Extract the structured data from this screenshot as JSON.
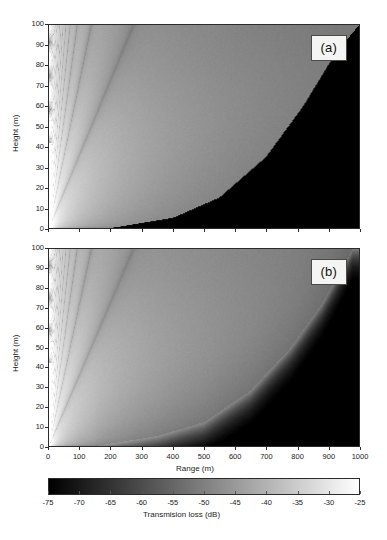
{
  "figure": {
    "background": "#ffffff",
    "width": 387,
    "height": 540
  },
  "panels": [
    {
      "tag": "(a)",
      "name": "panel-a",
      "xlabel": "",
      "ylabel": "Height (m)",
      "xlim": [
        0,
        1000
      ],
      "ylim": [
        0,
        100
      ],
      "show_xticklabels": false,
      "shadow_boundary": "sharp",
      "description": "Transmission loss field with sharp shadow-zone boundary"
    },
    {
      "tag": "(b)",
      "name": "panel-b",
      "xlabel": "Range (m)",
      "ylabel": "Height (m)",
      "xlim": [
        0,
        1000
      ],
      "ylim": [
        0,
        100
      ],
      "show_xticklabels": true,
      "shadow_boundary": "diffuse",
      "description": "Transmission loss field with diffuse shadow-zone boundary"
    }
  ],
  "axes": {
    "xticks": [
      0,
      100,
      200,
      300,
      400,
      500,
      600,
      700,
      800,
      900,
      1000
    ],
    "yticks": [
      0,
      10,
      20,
      30,
      40,
      50,
      60,
      70,
      80,
      90,
      100
    ],
    "xlabel": "Range (m)",
    "ylabel": "Height (m)"
  },
  "colorbar": {
    "label": "Transmision loss (dB)",
    "ticks": [
      -75,
      -70,
      -65,
      -60,
      -55,
      -50,
      -45,
      -40,
      -35,
      -30,
      -25
    ],
    "vmin": -75,
    "vmax": -25,
    "cmap": "gray",
    "low_color": "#000000",
    "high_color": "#ffffff",
    "orientation": "horizontal"
  },
  "chart_data": {
    "type": "heatmap",
    "title": "",
    "xlabel": "Range (m)",
    "ylabel": "Height (m)",
    "xlim": [
      0,
      1000
    ],
    "ylim": [
      0,
      100
    ],
    "zlabel": "Transmision loss (dB)",
    "zlim": [
      -75,
      -25
    ],
    "colormap": "grayscale",
    "grid": false,
    "legend": "colorbar-bottom",
    "panels": [
      {
        "label": "(a)",
        "source_height_m": 5,
        "source_range_m": 0,
        "shadow_zone": "sharp",
        "shadow_boundary_points": [
          {
            "range_m": 200,
            "height_m": 0
          },
          {
            "range_m": 400,
            "height_m": 5
          },
          {
            "range_m": 550,
            "height_m": 15
          },
          {
            "range_m": 700,
            "height_m": 35
          },
          {
            "range_m": 820,
            "height_m": 60
          },
          {
            "range_m": 920,
            "height_m": 85
          },
          {
            "range_m": 1000,
            "height_m": 100
          }
        ],
        "shadow_level_db": -75,
        "illuminated_level_db": -48,
        "near_field_level_db": -28,
        "interference_lobes": 16,
        "annotation": "Sharp caustic / shadow boundary, strong lobed interference near source"
      },
      {
        "label": "(b)",
        "source_height_m": 5,
        "source_range_m": 0,
        "shadow_zone": "diffuse",
        "shadow_boundary_points": [
          {
            "range_m": 150,
            "height_m": 0
          },
          {
            "range_m": 350,
            "height_m": 5
          },
          {
            "range_m": 500,
            "height_m": 12
          },
          {
            "range_m": 650,
            "height_m": 28
          },
          {
            "range_m": 780,
            "height_m": 50
          },
          {
            "range_m": 880,
            "height_m": 72
          },
          {
            "range_m": 980,
            "height_m": 100
          }
        ],
        "shadow_level_db": -75,
        "illuminated_level_db": -50,
        "near_field_level_db": -27,
        "interference_lobes": 16,
        "annotation": "Diffuse, smoothly decaying shadow boundary, same lobed near field"
      }
    ]
  }
}
